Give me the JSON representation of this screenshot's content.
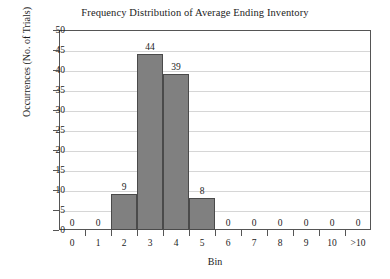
{
  "chart_data": {
    "type": "bar",
    "title": "Frequency Distribution of Average Ending Inventory",
    "xlabel": "Bin",
    "ylabel": "Occurrences (No. of Trials)",
    "categories": [
      "0",
      "1",
      "2",
      "3",
      "4",
      "5",
      "6",
      "7",
      "8",
      "9",
      "10",
      ">10"
    ],
    "values": [
      0,
      0,
      9,
      44,
      39,
      8,
      0,
      0,
      0,
      0,
      0,
      0
    ],
    "data_labels": [
      "0",
      "0",
      "9",
      "44",
      "39",
      "8",
      "0",
      "0",
      "0",
      "0",
      "0",
      "0"
    ],
    "ylim": [
      0,
      50
    ],
    "ytick_values": [
      0,
      5,
      10,
      15,
      20,
      25,
      30,
      35,
      40,
      45,
      50
    ],
    "ytick_labels": [
      "0",
      "5",
      "10",
      "15",
      "20",
      "25",
      "30",
      "35",
      "40",
      "45",
      "50"
    ],
    "grid": "horizontal",
    "legend": "none",
    "bar_color": "#808080",
    "bar_edge_color": "#4a4a4a",
    "grid_color": "#d6d6d6",
    "axis_color": "#555555",
    "background": "#ffffff"
  }
}
